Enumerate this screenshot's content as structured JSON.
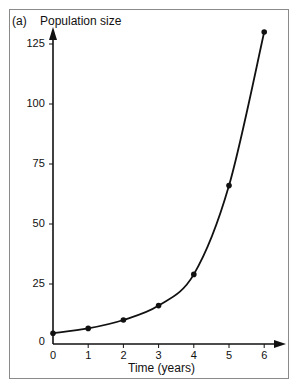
{
  "chart_data": {
    "type": "line",
    "title": "",
    "panel_label": "(a)",
    "xlabel": "Time (years)",
    "ylabel": "Population size",
    "x": [
      0,
      1,
      2,
      3,
      4,
      5,
      6
    ],
    "series": [
      {
        "name": "Population size",
        "values": [
          4.5,
          6.5,
          10,
          16,
          29,
          66,
          130
        ]
      }
    ],
    "x_ticks": [
      "0",
      "1",
      "2",
      "3",
      "4",
      "5",
      "6"
    ],
    "y_ticks": [
      "0",
      "25",
      "50",
      "75",
      "100",
      "125"
    ],
    "xlim": [
      0,
      6
    ],
    "ylim": [
      0,
      130
    ],
    "grid": false,
    "legend": "none",
    "markers": true,
    "smooth_curve": true
  },
  "colors": {
    "line": "#111111",
    "frame": "#8a8a8a"
  }
}
